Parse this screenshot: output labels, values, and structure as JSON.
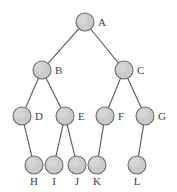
{
  "figure": {
    "type": "tree-diagram",
    "width": 177,
    "height": 192,
    "background_color": "#ffffff"
  },
  "style": {
    "node_fill": "#cbcbcb",
    "node_stroke": "#6b6b6b",
    "edge_color": "#595959",
    "label_color": "#3d3d3d",
    "node_radius": 9
  },
  "tree": {
    "root": "A",
    "levels": 4,
    "node_count": 12,
    "edge_count": 11,
    "nodes": [
      {
        "id": "A",
        "label": "A",
        "x": 85,
        "y": 22,
        "r": 9,
        "label_x": 98,
        "label_y": 22,
        "label_pos": "right",
        "level": 0
      },
      {
        "id": "B",
        "label": "B",
        "x": 42,
        "y": 70,
        "r": 9,
        "label_x": 55,
        "label_y": 70,
        "label_pos": "right",
        "level": 1
      },
      {
        "id": "C",
        "label": "C",
        "x": 124,
        "y": 70,
        "r": 9,
        "label_x": 137,
        "label_y": 70,
        "label_pos": "right",
        "level": 1
      },
      {
        "id": "D",
        "label": "D",
        "x": 22,
        "y": 116,
        "r": 9,
        "label_x": 35,
        "label_y": 116,
        "label_pos": "right",
        "level": 2
      },
      {
        "id": "E",
        "label": "E",
        "x": 65,
        "y": 116,
        "r": 9,
        "label_x": 78,
        "label_y": 116,
        "label_pos": "right",
        "level": 2
      },
      {
        "id": "F",
        "label": "F",
        "x": 105,
        "y": 116,
        "r": 9,
        "label_x": 118,
        "label_y": 116,
        "label_pos": "right",
        "level": 2
      },
      {
        "id": "G",
        "label": "G",
        "x": 145,
        "y": 116,
        "r": 9,
        "label_x": 158,
        "label_y": 116,
        "label_pos": "right",
        "level": 2
      },
      {
        "id": "H",
        "label": "H",
        "x": 34,
        "y": 165,
        "r": 9,
        "label_x": 34,
        "label_y": 176,
        "label_pos": "below",
        "level": 3
      },
      {
        "id": "I",
        "label": "I",
        "x": 54,
        "y": 165,
        "r": 9,
        "label_x": 54,
        "label_y": 176,
        "label_pos": "below",
        "level": 3
      },
      {
        "id": "J",
        "label": "J",
        "x": 77,
        "y": 165,
        "r": 9,
        "label_x": 77,
        "label_y": 176,
        "label_pos": "below",
        "level": 3
      },
      {
        "id": "K",
        "label": "K",
        "x": 97,
        "y": 165,
        "r": 9,
        "label_x": 97,
        "label_y": 176,
        "label_pos": "below",
        "level": 3
      },
      {
        "id": "L",
        "label": "L",
        "x": 137,
        "y": 165,
        "r": 9,
        "label_x": 137,
        "label_y": 176,
        "label_pos": "below",
        "level": 3
      }
    ],
    "edges": [
      {
        "from": "A",
        "to": "B"
      },
      {
        "from": "A",
        "to": "C"
      },
      {
        "from": "B",
        "to": "D"
      },
      {
        "from": "B",
        "to": "E"
      },
      {
        "from": "C",
        "to": "F"
      },
      {
        "from": "C",
        "to": "G"
      },
      {
        "from": "D",
        "to": "H"
      },
      {
        "from": "E",
        "to": "I"
      },
      {
        "from": "E",
        "to": "J"
      },
      {
        "from": "F",
        "to": "K"
      },
      {
        "from": "G",
        "to": "L"
      }
    ]
  }
}
